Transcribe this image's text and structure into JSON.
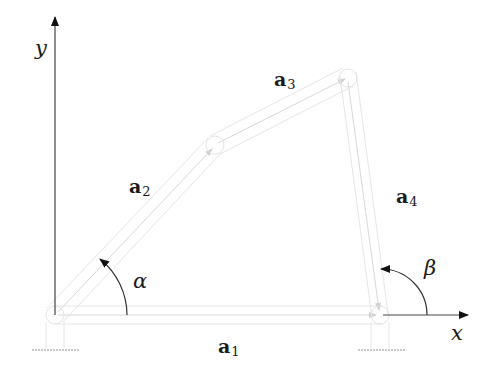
{
  "diagram": {
    "axes": {
      "x_label": "x",
      "y_label": "y"
    },
    "links": [
      {
        "id": "a1",
        "base": "a",
        "subscript": "1"
      },
      {
        "id": "a2",
        "base": "a",
        "subscript": "2"
      },
      {
        "id": "a3",
        "base": "a",
        "subscript": "3"
      },
      {
        "id": "a4",
        "base": "a",
        "subscript": "4"
      }
    ],
    "angles": [
      {
        "id": "alpha",
        "symbol": "α"
      },
      {
        "id": "beta",
        "symbol": "β"
      }
    ],
    "colors": {
      "axis": "#333333",
      "link": "#e2e2e2",
      "ground": "#bbbbbb",
      "text": "#1a1a1a"
    }
  }
}
